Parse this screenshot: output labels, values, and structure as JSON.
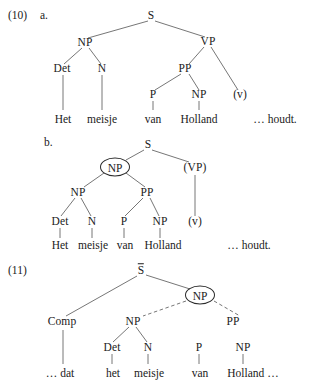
{
  "figure": {
    "type": "syntax-tree-diagram",
    "language": "Dutch",
    "sentence_gloss": "Het meisje van Holland ... houdt.",
    "examples": [
      {
        "number": "(10)",
        "sublabel": "a.",
        "nodes": {
          "s": "S",
          "np": "NP",
          "vp": "VP",
          "det": "Det",
          "n": "N",
          "pp": "PP",
          "p": "P",
          "np2": "NP",
          "v": "(v)"
        },
        "terminals": {
          "het": "Het",
          "meisje": "meisje",
          "van": "van",
          "holland": "Holland",
          "houdt": "… houdt."
        }
      },
      {
        "number": "",
        "sublabel": "b.",
        "nodes": {
          "s": "S",
          "np_circled": "NP",
          "vp": "(VP)",
          "np": "NP",
          "pp": "PP",
          "det": "Det",
          "n": "N",
          "p": "P",
          "np2": "NP",
          "v": "(v)"
        },
        "terminals": {
          "het": "Het",
          "meisje": "meisje",
          "van": "van",
          "holland": "Holland",
          "houdt": "… houdt."
        }
      },
      {
        "number": "(11)",
        "sublabel": "",
        "nodes": {
          "sbar": "S",
          "np_circled": "NP",
          "comp": "Comp",
          "np": "NP",
          "pp": "PP",
          "det": "Det",
          "n": "N",
          "p": "P",
          "np2": "NP"
        },
        "terminals": {
          "dat": "… dat",
          "het": "het",
          "meisje": "meisje",
          "van": "van",
          "holland": "Holland …"
        }
      }
    ]
  },
  "colors": {
    "ink": "#1a1a1a",
    "line": "#555555",
    "page": "#ffffff"
  }
}
